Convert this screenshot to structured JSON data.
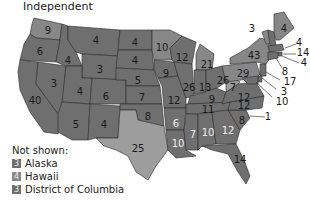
{
  "title": "Independent",
  "colors": {
    "dark": "#6f6f6f",
    "medium": "#878787",
    "light": "#9d9d9d",
    "border": "#2a2a2a"
  },
  "states": [
    {
      "abbr": "WA",
      "value": "9",
      "shade": "medium"
    },
    {
      "abbr": "OR",
      "value": "6",
      "shade": "dark"
    },
    {
      "abbr": "CA",
      "value": "40",
      "shade": "dark"
    },
    {
      "abbr": "ID",
      "value": "4",
      "shade": "dark"
    },
    {
      "abbr": "NV",
      "value": "3",
      "shade": "dark"
    },
    {
      "abbr": "MT",
      "value": "4",
      "shade": "dark"
    },
    {
      "abbr": "WY",
      "value": "3",
      "shade": "dark"
    },
    {
      "abbr": "UT",
      "value": "4",
      "shade": "dark"
    },
    {
      "abbr": "AZ",
      "value": "5",
      "shade": "dark"
    },
    {
      "abbr": "CO",
      "value": "6",
      "shade": "dark"
    },
    {
      "abbr": "NM",
      "value": "4",
      "shade": "dark"
    },
    {
      "abbr": "ND",
      "value": "4",
      "shade": "dark"
    },
    {
      "abbr": "SD",
      "value": "4",
      "shade": "dark"
    },
    {
      "abbr": "NE",
      "value": "5",
      "shade": "dark"
    },
    {
      "abbr": "KS",
      "value": "7",
      "shade": "dark"
    },
    {
      "abbr": "OK",
      "value": "8",
      "shade": "dark"
    },
    {
      "abbr": "TX",
      "value": "25",
      "shade": "light"
    },
    {
      "abbr": "MN",
      "value": "10",
      "shade": "medium"
    },
    {
      "abbr": "IA",
      "value": "9",
      "shade": "dark"
    },
    {
      "abbr": "MO",
      "value": "12",
      "shade": "dark"
    },
    {
      "abbr": "AR",
      "value": "6",
      "shade": "dark"
    },
    {
      "abbr": "LA",
      "value": "10",
      "shade": "dark"
    },
    {
      "abbr": "WI",
      "value": "12",
      "shade": "dark"
    },
    {
      "abbr": "IL",
      "value": "26",
      "shade": "dark"
    },
    {
      "abbr": "MI",
      "value": "21",
      "shade": "medium"
    },
    {
      "abbr": "IN",
      "value": "13",
      "shade": "dark"
    },
    {
      "abbr": "OH",
      "value": "26",
      "shade": "dark"
    },
    {
      "abbr": "KY",
      "value": "9",
      "shade": "dark"
    },
    {
      "abbr": "TN",
      "value": "11",
      "shade": "dark"
    },
    {
      "abbr": "MS",
      "value": "7",
      "shade": "dark"
    },
    {
      "abbr": "AL",
      "value": "10",
      "shade": "dark"
    },
    {
      "abbr": "GA",
      "value": "12",
      "shade": "dark"
    },
    {
      "abbr": "FL",
      "value": "14",
      "shade": "dark"
    },
    {
      "abbr": "SC",
      "value": "8",
      "shade": "dark"
    },
    {
      "abbr": "NC",
      "value": "12",
      "shade": "dark"
    },
    {
      "abbr": "VA",
      "value": "12",
      "shade": "dark"
    },
    {
      "abbr": "WV",
      "value": "7",
      "shade": "light"
    },
    {
      "abbr": "PA",
      "value": "29",
      "shade": "medium"
    },
    {
      "abbr": "NY",
      "value": "43",
      "shade": "medium"
    },
    {
      "abbr": "VT",
      "value": "3",
      "shade": "medium"
    },
    {
      "abbr": "NH",
      "value": "4",
      "shade": "dark"
    },
    {
      "abbr": "ME",
      "value": "4",
      "shade": "medium"
    },
    {
      "abbr": "MA",
      "value": "14",
      "shade": "dark"
    },
    {
      "abbr": "RI",
      "value": "4",
      "shade": "dark"
    },
    {
      "abbr": "CT",
      "value": "8",
      "shade": "dark"
    },
    {
      "abbr": "NJ",
      "value": "17",
      "shade": "dark"
    },
    {
      "abbr": "DE",
      "value": "3",
      "shade": "dark"
    },
    {
      "abbr": "MD",
      "value": "10",
      "shade": "dark"
    },
    {
      "abbr": "DC",
      "value": "1",
      "shade": "dark"
    }
  ],
  "legend": {
    "heading": "Not shown:",
    "items": [
      {
        "value": "3",
        "label": "Alaska",
        "shade": "dark"
      },
      {
        "value": "4",
        "label": "Hawaii",
        "shade": "medium"
      },
      {
        "value": "3",
        "label": "District of Columbia",
        "shade": "dark"
      }
    ]
  }
}
